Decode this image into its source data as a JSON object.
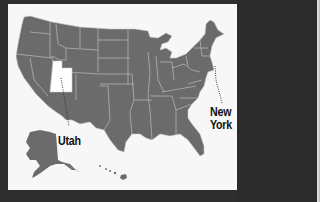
{
  "map": {
    "subject": "United States",
    "state_fill": "#6b6b6b",
    "border_color": "#c9c9c9",
    "highlight_fill": "#ffffff",
    "background": "#f7f7f7",
    "frame_color": "#2e2e2e",
    "highlighted_states": [
      "Utah"
    ],
    "callouts": [
      {
        "state": "Utah",
        "label": "Utah"
      },
      {
        "state": "New York",
        "label_line1": "New",
        "label_line2": "York"
      }
    ]
  }
}
